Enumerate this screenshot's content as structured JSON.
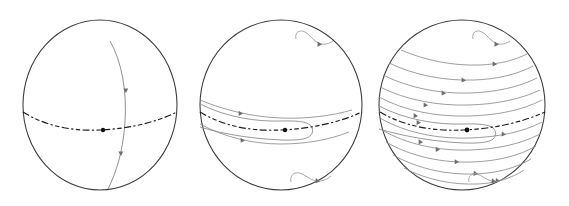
{
  "figure": {
    "title": "",
    "background_color": "#ffffff",
    "width": 569,
    "height": 206,
    "panel_count": 3
  },
  "style": {
    "outline_color": "#3a3a3a",
    "equator_color": "#1c1c1c",
    "streamline_color": "#8d8d8d",
    "meridian_color": "#8a8a8a",
    "arrow_color": "#6e6e6e",
    "fixed_point_color": "#111111"
  },
  "panels": [
    {
      "id": "panel-left",
      "label": "",
      "center_x": 100,
      "center_y": 105,
      "radius_x": 77,
      "radius_y": 85,
      "equator": {
        "visible": true,
        "style": "dash-dot",
        "sag": 14
      },
      "fixed_point": {
        "x": 104,
        "y": 126,
        "radius": 2.2
      },
      "meridian": {
        "visible": true,
        "arrow_count": 2,
        "description": "single meridional curve through fixed point"
      },
      "streamline_count": 0,
      "polar_hooks": 0
    },
    {
      "id": "panel-middle",
      "label": "",
      "center_x": 281,
      "center_y": 105,
      "radius_x": 81,
      "radius_y": 85,
      "equator": {
        "visible": true,
        "style": "dash-dot",
        "sag": 14
      },
      "fixed_point": {
        "x": 285,
        "y": 126,
        "radius": 2.2
      },
      "meridian": {
        "visible": false,
        "arrow_count": 0,
        "description": ""
      },
      "streamline_count": 2,
      "closed_loop": {
        "visible": true,
        "description": "cat's-eye closed streamline straddling the equator",
        "arrow_count": 2
      },
      "polar_hooks": 2
    },
    {
      "id": "panel-right",
      "label": "",
      "center_x": 462,
      "center_y": 105,
      "radius_x": 83,
      "radius_y": 85,
      "equator": {
        "visible": true,
        "style": "dash-dot",
        "sag": 14
      },
      "fixed_point": {
        "x": 466,
        "y": 126,
        "radius": 2.4
      },
      "meridian": {
        "visible": false,
        "arrow_count": 0,
        "description": ""
      },
      "streamline_count": 12,
      "closed_loop": {
        "visible": true,
        "description": "cat's-eye closed streamline straddling the equator",
        "arrow_count": 2
      },
      "polar_hooks": 2
    }
  ]
}
